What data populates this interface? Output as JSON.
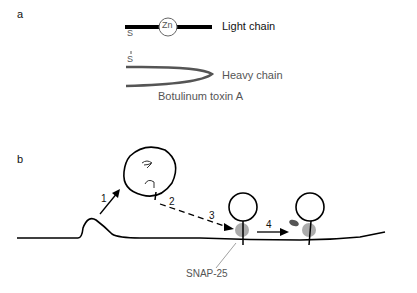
{
  "panel_a": {
    "label": "a",
    "zinc": "Zn",
    "disulfide_top": "S",
    "disulfide_bottom": "S",
    "light_chain": "Light chain",
    "heavy_chain": "Heavy chain",
    "caption": "Botulinum toxin A"
  },
  "panel_b": {
    "label": "b",
    "steps": [
      "1",
      "2",
      "3",
      "4"
    ],
    "snap_label": "SNAP-25"
  }
}
